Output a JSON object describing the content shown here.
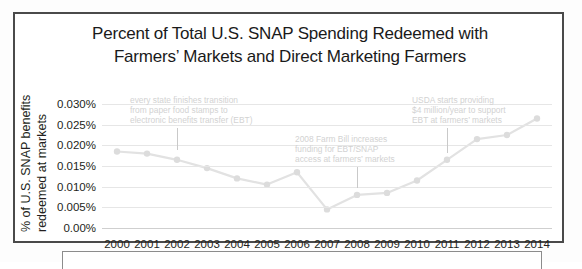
{
  "figure": {
    "title_lines": [
      "Percent of Total U.S. SNAP Spending Redeemed with",
      "Farmers’ Markets and Direct Marketing Farmers"
    ],
    "y_axis_title_lines": [
      "% of U.S. SNAP benefits",
      "redeemed at markets"
    ]
  },
  "chart_data": {
    "type": "line",
    "title": "Percent of Total U.S. SNAP Spending Redeemed with Farmers’ Markets and Direct Marketing Farmers",
    "xlabel": "",
    "ylabel": "% of U.S. SNAP benefits redeemed at markets",
    "categories": [
      "2000",
      "2001",
      "2002",
      "2003",
      "2004",
      "2005",
      "2006",
      "2007",
      "2008",
      "2009",
      "2010",
      "2011",
      "2012",
      "2013",
      "2014"
    ],
    "values": [
      0.0185,
      0.018,
      0.0165,
      0.0145,
      0.012,
      0.0105,
      0.0135,
      0.0045,
      0.008,
      0.0085,
      0.0115,
      0.0165,
      0.0215,
      0.0225,
      0.0265
    ],
    "value_unit": "percent",
    "ytick_labels": [
      "0.030%",
      "0.025%",
      "0.020%",
      "0.015%",
      "0.010%",
      "0.005%",
      "0.00%"
    ],
    "ytick_values": [
      0.03,
      0.025,
      0.02,
      0.015,
      0.01,
      0.005,
      0.0
    ],
    "ylim": [
      0.0,
      0.03
    ],
    "grid": true,
    "legend": "none",
    "series_color": "#e2e2e2",
    "marker_color": "#dcdcdc",
    "annotations": [
      {
        "id": "ebt-transition",
        "lines": [
          "every state finishes transition",
          "from paper food stamps to",
          "electronic benefits transfer (EBT)"
        ],
        "points_to_year": "2002"
      },
      {
        "id": "farm-bill-2008",
        "lines": [
          "2008 Farm Bill increases",
          "funding for EBT/SNAP",
          "access at farmers’ markets"
        ],
        "points_to_year": "2008"
      },
      {
        "id": "usda-funding",
        "lines": [
          "USDA starts providing",
          "$4 million/year to support",
          "EBT at farmers’ markets"
        ],
        "points_to_year": "2011"
      }
    ]
  }
}
